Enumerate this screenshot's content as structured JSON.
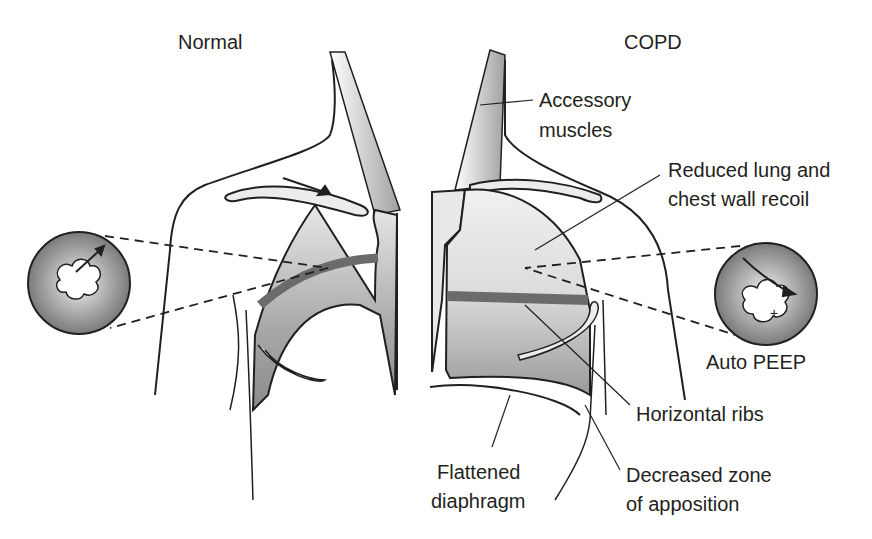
{
  "titles": {
    "normal": "Normal",
    "copd": "COPD"
  },
  "labels": {
    "accessory_1": "Accessory",
    "accessory_2": "muscles",
    "recoil_1": "Reduced lung and",
    "recoil_2": "chest wall recoil",
    "auto_peep": "Auto PEEP",
    "horizontal_ribs": "Horizontal ribs",
    "flattened_1": "Flattened",
    "flattened_2": "diaphragm",
    "zone_1": "Decreased zone",
    "zone_2": "of apposition"
  },
  "colors": {
    "line": "#231f20",
    "lung_light": "#e6e6e6",
    "lung_dark": "#9a9a9a",
    "band": "#6b6b6b"
  }
}
